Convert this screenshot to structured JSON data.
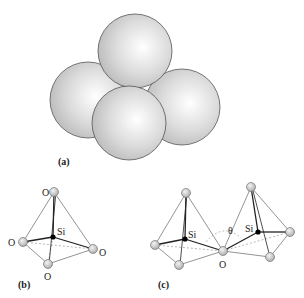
{
  "figure": {
    "panels": [
      {
        "id": "a",
        "label": "(a)",
        "description": "Four close-packed spheres forming a tetrahedron"
      },
      {
        "id": "b",
        "label": "(b)",
        "description": "SiO4 tetrahedron"
      },
      {
        "id": "c",
        "label": "(c)",
        "description": "Two corner-sharing SiO4 tetrahedra with bridging angle"
      }
    ],
    "atoms": {
      "oxygen": "O",
      "silicon": "Si"
    },
    "angle_symbol": "θ",
    "colors": {
      "sphere_fill": "#d8d8d8",
      "sphere_highlight": "#ffffff",
      "sphere_edge": "#555555",
      "bond": "#222222",
      "edge": "#555555",
      "dashed": "#888888",
      "silicon": "#000000"
    }
  }
}
